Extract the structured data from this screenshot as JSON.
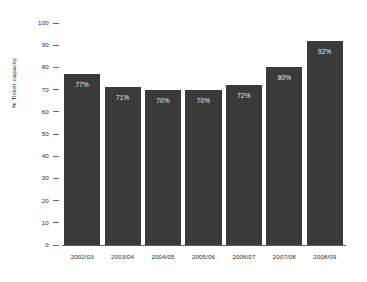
{
  "chart_data": {
    "type": "bar",
    "title": "",
    "xlabel": "",
    "ylabel": "% Ticket capacity",
    "categories": [
      "2002/03",
      "2003/04",
      "2004/05",
      "2005/06",
      "2006/07",
      "2007/08",
      "2008/09"
    ],
    "values": [
      77,
      71,
      70,
      70,
      72,
      80,
      92
    ],
    "value_labels": [
      "77%",
      "71%",
      "70%",
      "70%",
      "72%",
      "80%",
      "92%"
    ],
    "ylim": [
      0,
      100
    ],
    "ytick_labels": [
      "100",
      "90",
      "80",
      "70",
      "60",
      "50",
      "40",
      "30",
      "20",
      "10",
      "0"
    ],
    "ytick_values": [
      100,
      90,
      80,
      70,
      60,
      50,
      40,
      30,
      20,
      10,
      0
    ],
    "grid": false,
    "legend": null,
    "series": [
      {
        "name": "% Ticket capacity",
        "values": [
          77,
          71,
          70,
          70,
          72,
          80,
          92
        ]
      }
    ],
    "colors": {
      "bar": "#3a3a3a",
      "background": "#ffffff",
      "text": "#2b2b2b",
      "bar_label_text": "#f0f0f0",
      "axis_line": "#5e5e5e"
    }
  }
}
